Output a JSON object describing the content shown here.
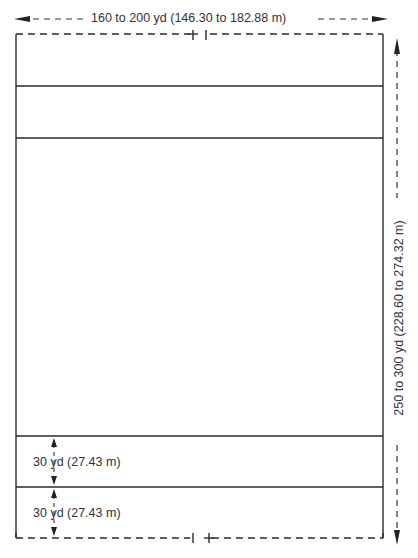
{
  "diagram": {
    "width_label": "160 to 200 yd (146.30 to 182.88 m)",
    "length_label": "250 to 300 yd (228.60 to 274.32 m)",
    "zones": [
      {
        "label": "30 yd (27.43 m)"
      },
      {
        "label": "30 yd (27.43 m)"
      }
    ],
    "colors": {
      "line": "#2a2a2a",
      "background": "#ffffff"
    }
  }
}
